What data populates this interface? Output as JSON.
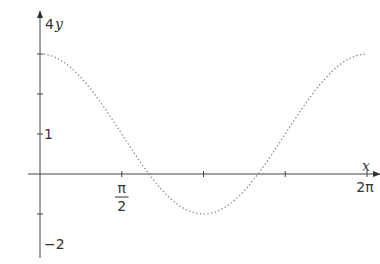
{
  "chart_data": {
    "type": "line",
    "title": "",
    "function": "y = 1 + 2cos(x)",
    "xlabel": "x",
    "ylabel": "y",
    "xlim": [
      0,
      6.2832
    ],
    "ylim": [
      -2,
      4
    ],
    "x_ticks": [
      "0",
      "π/2",
      "π",
      "3π/2",
      "2π"
    ],
    "x_tick_labels_shown": [
      "π/2",
      "2π"
    ],
    "y_ticks": [
      -2,
      -1,
      1,
      2,
      3,
      4
    ],
    "y_tick_labels_shown": [
      "4",
      "1",
      "−2"
    ],
    "grid": false,
    "series": [
      {
        "name": "curve",
        "style": "dotted",
        "color": "#888888",
        "x": [
          0,
          0.5236,
          1.0472,
          1.5708,
          2.0944,
          2.618,
          3.1416,
          3.6652,
          4.1888,
          4.7124,
          5.236,
          5.7596,
          6.2832
        ],
        "values": [
          3,
          2.732,
          2,
          1,
          0,
          -0.732,
          -1,
          -0.732,
          0,
          1,
          2,
          2.732,
          3
        ]
      }
    ]
  },
  "labels": {
    "y_top": "4",
    "y_var": "y",
    "x_var": "x",
    "one": "1",
    "minus_two": "−2",
    "pi": "π",
    "two": "2",
    "two_pi": "2π"
  },
  "colors": {
    "axis": "#444444",
    "curve": "#888888"
  }
}
